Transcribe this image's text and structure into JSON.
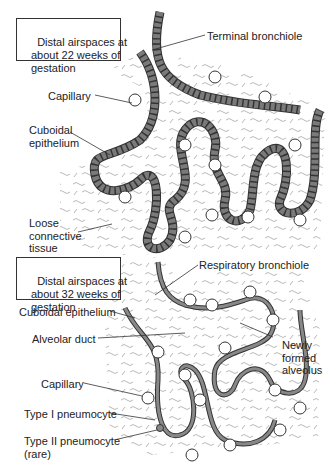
{
  "panels": [
    {
      "title": "Distal airspaces at\nabout 22 weeks of\ngestation",
      "labels": {
        "terminal_bronchiole": "Terminal bronchiole",
        "capillary": "Capillary",
        "cuboidal_epithelium": "Cuboidal\nepithelium",
        "loose_connective_tissue": "Loose\nconnective\ntissue"
      }
    },
    {
      "title": "Distal airspaces at\nabout 32 weeks of\ngestation",
      "labels": {
        "respiratory_bronchiole": "Respiratory bronchiole",
        "cuboidal_epithelium": "Cuboidal epithelium",
        "alveolar_duct": "Alveolar duct",
        "newly_formed_alveolus": "Newly\nformed\nalveolus",
        "capillary": "Capillary",
        "type_i_pneumocyte": "Type I pneumocyte",
        "type_ii_pneumocyte": "Type II pneumocyte\n(rare)"
      }
    }
  ],
  "colors": {
    "epithelium": "#7a7a7a",
    "line": "#333333",
    "tissue": "#888888"
  }
}
